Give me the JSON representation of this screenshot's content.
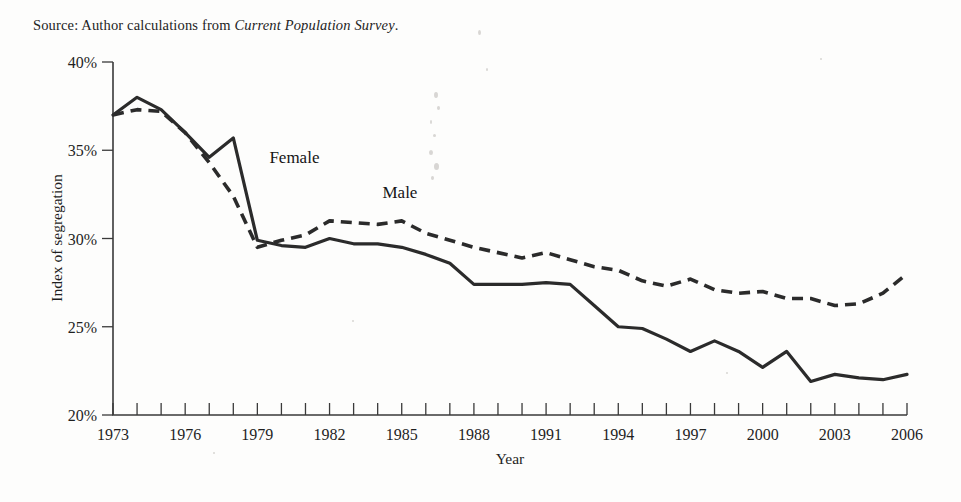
{
  "source_note": {
    "prefix": "Source: Author calculations from ",
    "italic": "Current Population Survey",
    "suffix": "."
  },
  "chart_data": {
    "type": "line",
    "title": "",
    "xlabel": "Year",
    "ylabel": "Index of segregation",
    "xlim": [
      1973,
      2006
    ],
    "ylim": [
      20,
      40
    ],
    "ytick_labels": [
      "40%",
      "35%",
      "30%",
      "25%",
      "20%"
    ],
    "ytick_values": [
      40,
      35,
      30,
      25,
      20
    ],
    "xtick_labels": [
      "1973",
      "1976",
      "1979",
      "1982",
      "1985",
      "1988",
      "1991",
      "1994",
      "1997",
      "2000",
      "2003",
      "2006"
    ],
    "xtick_values": [
      1973,
      1976,
      1979,
      1982,
      1985,
      1988,
      1991,
      1994,
      1997,
      2000,
      2003,
      2006
    ],
    "minor_xticks_every": 1,
    "grid": false,
    "legend_position": "inline-annotations",
    "x": [
      1973,
      1974,
      1975,
      1976,
      1977,
      1978,
      1979,
      1980,
      1981,
      1982,
      1983,
      1984,
      1985,
      1986,
      1987,
      1988,
      1989,
      1990,
      1991,
      1992,
      1993,
      1994,
      1995,
      1996,
      1997,
      1998,
      1999,
      2000,
      2001,
      2002,
      2003,
      2004,
      2005,
      2006
    ],
    "series": [
      {
        "name": "Female",
        "style": "solid",
        "label_x": 1979.5,
        "label_y": 34.3,
        "values": [
          37.0,
          38.0,
          37.3,
          36.0,
          34.6,
          35.7,
          29.9,
          29.6,
          29.5,
          30.0,
          29.7,
          29.7,
          29.5,
          29.1,
          28.6,
          27.4,
          27.4,
          27.4,
          27.5,
          27.4,
          26.2,
          25.0,
          24.9,
          24.3,
          23.6,
          24.2,
          23.6,
          22.7,
          23.6,
          21.9,
          22.3,
          22.1,
          22.0,
          22.3
        ]
      },
      {
        "name": "Male",
        "style": "dashed",
        "label_x": 1984.2,
        "label_y": 32.3,
        "values": [
          37.0,
          37.3,
          37.2,
          36.0,
          34.3,
          32.4,
          29.5,
          29.9,
          30.2,
          31.0,
          30.9,
          30.8,
          31.0,
          30.3,
          29.9,
          29.5,
          29.2,
          28.9,
          29.2,
          28.8,
          28.4,
          28.2,
          27.6,
          27.3,
          27.7,
          27.1,
          26.9,
          27.0,
          26.6,
          26.6,
          26.2,
          26.3,
          26.9,
          28.0
        ]
      }
    ]
  }
}
